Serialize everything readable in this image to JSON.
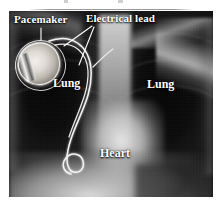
{
  "figure": {
    "type": "chest-radiograph",
    "modality": "X-ray",
    "view": "posteroanterior chest",
    "frame": {
      "x": 9,
      "y": 11,
      "width": 204,
      "height": 186
    },
    "background_color": "#ffffff",
    "film_color": "#0a0a0a",
    "annotation_color": "#ffffff"
  },
  "labels": {
    "pacemaker": "Pacemaker",
    "electrical_lead": "Electrical lead",
    "lung_left": "Lung",
    "lung_right": "Lung",
    "heart": "Heart"
  },
  "annotations": [
    {
      "name": "pacemaker",
      "text": "Pacemaker",
      "leader": "vertical-line-down"
    },
    {
      "name": "electrical-lead",
      "text": "Electrical lead",
      "leader": "two-lines-down-left"
    },
    {
      "name": "lung-left",
      "text": "Lung",
      "leader": "none"
    },
    {
      "name": "lung-right",
      "text": "Lung",
      "leader": "none"
    },
    {
      "name": "heart",
      "text": "Heart",
      "leader": "none"
    }
  ],
  "anatomy": [
    {
      "name": "pacemaker-device",
      "description": "oval implanted pulse generator, upper left chest"
    },
    {
      "name": "lead-wire",
      "description": "bright curved electrode wire from device to heart with distal loop"
    },
    {
      "name": "lung-field-left",
      "description": "dark radiolucent lung field"
    },
    {
      "name": "lung-field-right",
      "description": "dark radiolucent lung field"
    },
    {
      "name": "mediastinum-spine",
      "description": "bright central column"
    },
    {
      "name": "heart-silhouette",
      "description": "bright central mass"
    },
    {
      "name": "diaphragm",
      "description": "bright band across lower image"
    },
    {
      "name": "humerus-shoulder",
      "description": "bright bone, upper right"
    }
  ]
}
